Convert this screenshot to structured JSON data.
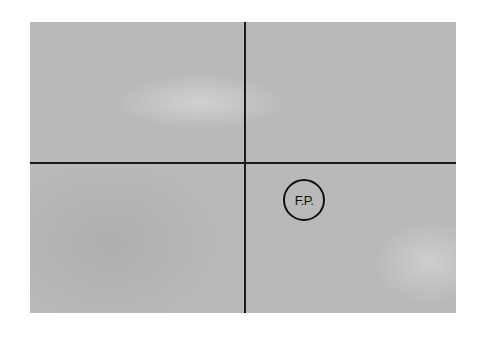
{
  "diagram": {
    "colors": {
      "field": "#b9b9b9",
      "lines": "#1a1a1a",
      "background": "#ffffff"
    },
    "marker": {
      "label": "F.P."
    }
  }
}
